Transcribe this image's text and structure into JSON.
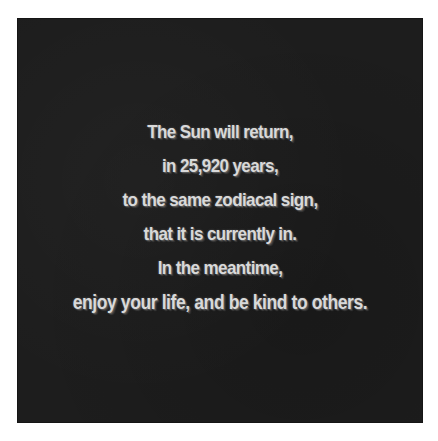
{
  "image": {
    "background_color": "#ffffff",
    "panel_color": "#1d1d1d",
    "text_color": "#d9d9d9",
    "lines": [
      "The Sun will return,",
      "in 25,920 years,",
      "to the same zodiacal sign,",
      "that it is currently in.",
      "In the meantime,",
      "enjoy your life, and be kind to others."
    ]
  }
}
